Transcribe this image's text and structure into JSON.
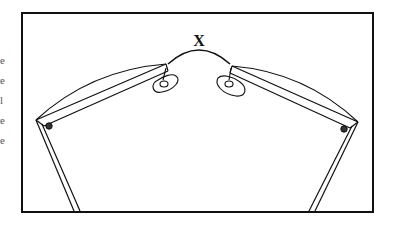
{
  "figure": {
    "bridge_label": "X",
    "frame_color": "#111111",
    "background": "#ffffff",
    "parts": [
      "bridge",
      "left-nose-pad",
      "right-nose-pad",
      "left-lens-rim",
      "right-lens-rim",
      "left-hinge-screw",
      "right-hinge-screw",
      "left-temple",
      "right-temple"
    ]
  },
  "margin_fragments": [
    "e",
    "e",
    "l",
    "e",
    "e"
  ]
}
